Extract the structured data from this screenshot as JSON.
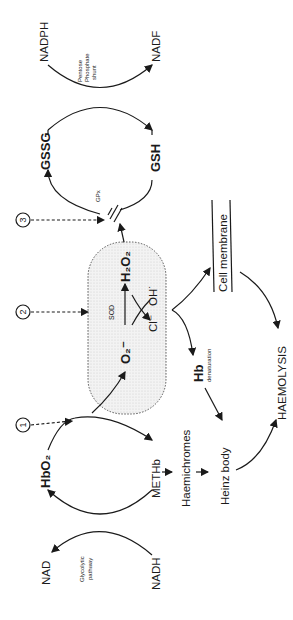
{
  "diagram": {
    "orientation": "rotated 90 degrees counter-clockwise",
    "nodes": {
      "nadph": "NADPH",
      "nadp": "NADF",
      "pentose_shunt": [
        "Pentose",
        "Phosphate",
        "shunt"
      ],
      "gssg": "GSSG",
      "gsh": "GSH",
      "gpx": "GPx",
      "h2o2": "H₂O₂",
      "sod": "SOD",
      "o2_radical": "O₂⁻",
      "oh_radical": "OH˙",
      "cl": "Cl⁻",
      "hbo2": "HbO₂",
      "methb": "METHb",
      "haemichromes": "Haemichromes",
      "heinz_body": "Heinz body",
      "hb": "Hb",
      "hb_denaturation": "denaturation",
      "cell_membrane": "Cell membrane",
      "haemolysis": "HAEMOLYSIS",
      "nad": "NAD",
      "nadh": "NADH",
      "glycolytic": [
        "Glycolytic",
        "pathway"
      ]
    },
    "markers": [
      "1",
      "2",
      "3"
    ]
  }
}
